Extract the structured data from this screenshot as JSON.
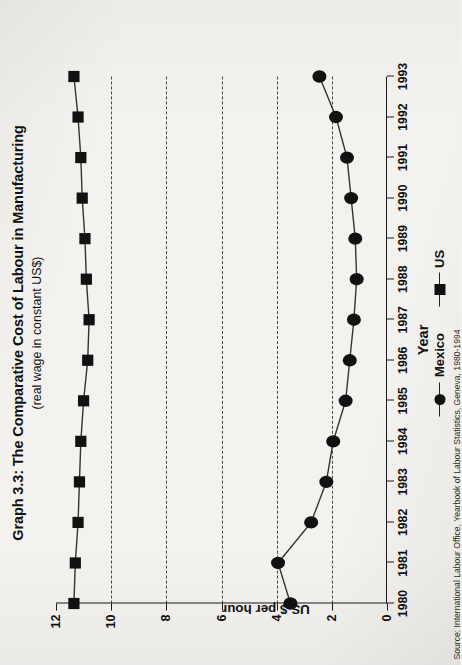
{
  "title": "Graph 3.3: The Comparative Cost of Labour in Manufacturing",
  "subtitle": "(real wage in constant US$)",
  "source": "Source: International Labour Office, Yearbook of Labour Statistics, Geneva, 1980-1994",
  "legend": {
    "mexico_label": "Mexico",
    "us_label": "US",
    "mexico_marker": "circle-marker-icon",
    "us_marker": "square-marker-icon"
  },
  "chart_data": {
    "type": "line",
    "title": "Graph 3.3: The Comparative Cost of Labour in Manufacturing",
    "subtitle": "(real wage in constant US$)",
    "xlabel": "Year",
    "ylabel": "US $ per hour",
    "xlim": [
      1980,
      1993
    ],
    "ylim": [
      0,
      12
    ],
    "yticks": [
      0,
      2,
      4,
      6,
      8,
      10,
      12
    ],
    "ytick_labels": [
      "0",
      "2",
      "4",
      "6",
      "8",
      "10",
      "12"
    ],
    "x": [
      1980,
      1981,
      1982,
      1983,
      1984,
      1985,
      1986,
      1987,
      1988,
      1989,
      1990,
      1991,
      1992,
      1993
    ],
    "xtick_labels": [
      "1980",
      "1981",
      "1982",
      "1983",
      "1984",
      "1985",
      "1986",
      "1987",
      "1988",
      "1989",
      "1990",
      "1991",
      "1992",
      "1993"
    ],
    "grid": "vertical-dashed-at-y-2-4-6-8-10",
    "gridlines": [
      2,
      4,
      6,
      8,
      10
    ],
    "legend_position": "bottom-center",
    "marker_color": "#111111",
    "line_color": "#333333",
    "series": [
      {
        "name": "US",
        "marker": "square",
        "values": [
          11.35,
          11.3,
          11.2,
          11.15,
          11.1,
          11.0,
          10.85,
          10.8,
          10.9,
          10.95,
          11.05,
          11.1,
          11.2,
          11.35
        ]
      },
      {
        "name": "Mexico",
        "marker": "circle",
        "values": [
          3.5,
          3.95,
          2.75,
          2.2,
          1.95,
          1.5,
          1.35,
          1.2,
          1.1,
          1.15,
          1.3,
          1.45,
          1.85,
          2.45
        ]
      }
    ]
  }
}
